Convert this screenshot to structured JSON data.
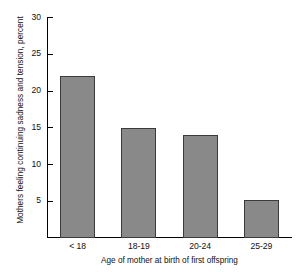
{
  "chart_data": {
    "type": "bar",
    "title": "",
    "subtitle": "",
    "categories": [
      "< 18",
      "18-19",
      "20-24",
      "25-29"
    ],
    "values": [
      22,
      15,
      14,
      5.2
    ],
    "xlabel": "Age of mother at birth of first offspring",
    "ylabel": "Mothers feeling continuing sadness and tension, percent",
    "ylim": [
      0,
      30
    ],
    "yticks": [
      5,
      10,
      15,
      20,
      25,
      30
    ],
    "ytick_labels": [
      "5",
      "10",
      "15",
      "20",
      "25",
      "30"
    ],
    "grid": false,
    "legend": null,
    "legend_position": "none",
    "bar_color": "#898989",
    "bar_edge_color": "#3b3b3b",
    "axis_color": "#000000",
    "background_color": "#ffffff",
    "annotations": []
  }
}
